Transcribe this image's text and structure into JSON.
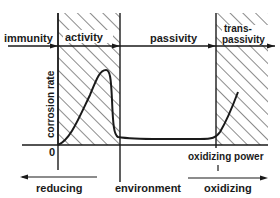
{
  "diagram": {
    "type": "corrosion-regions",
    "regions": {
      "immunity": "immunity",
      "activity": "activity",
      "passivity": "passivity",
      "transpassivity_line1": "trans-",
      "transpassivity_line2": "passivity"
    },
    "y_axis_label": "corrosion rate",
    "origin_label": "0",
    "x_axis_label": "oxidizing power",
    "environment": {
      "reducing": "reducing",
      "center": "environment",
      "oxidizing": "oxidizing"
    },
    "colors": {
      "ink": "#1a1a1a",
      "background": "#ffffff"
    }
  }
}
